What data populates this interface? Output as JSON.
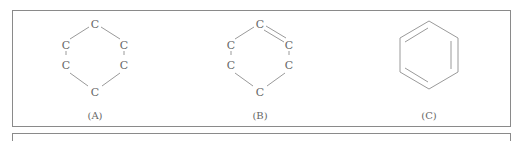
{
  "structures": [
    {
      "id": "A",
      "caption": "(A)",
      "atoms": [
        "C",
        "C",
        "C",
        "C",
        "C",
        "C"
      ],
      "double_bonds": []
    },
    {
      "id": "B",
      "caption": "(B)",
      "atoms": [
        "C",
        "C",
        "C",
        "C",
        "C",
        "C"
      ],
      "double_bonds": [
        "top-to-upper-right"
      ]
    },
    {
      "id": "C",
      "caption": "(C)",
      "atoms": [],
      "double_bonds": [
        "top-left",
        "right",
        "bottom-left"
      ]
    }
  ],
  "colors": {
    "border": "#8a8a8a",
    "bond": "#9a9a9a",
    "text": "#666666"
  }
}
